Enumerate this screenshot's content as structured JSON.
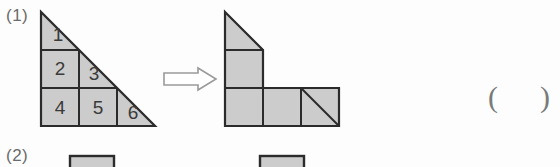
{
  "page": {
    "background_color": "#fdfdfd",
    "width": 560,
    "height": 167
  },
  "style": {
    "shape_fill": "#cccccc",
    "shape_stroke": "#2b2b2b",
    "digit_color": "#3a3a3a",
    "label_color": "#6b6b6b",
    "arrow_stroke": "#9a9a9a"
  },
  "problems": [
    {
      "label": "(1)",
      "answer_blank": {
        "open": "(",
        "close": ")"
      }
    },
    {
      "label": "(2)"
    }
  ],
  "arrow": {
    "glyph": "⟹",
    "direction": "right",
    "name": "transforms-into"
  },
  "left_figure": {
    "name": "right-triangle-grid",
    "description": "Right triangle subdivided into 6 numbered pieces",
    "grid": {
      "columns": 3,
      "rows": 3,
      "cell_px": 38
    },
    "cells": [
      {
        "id": 1,
        "label": "1",
        "col": 0,
        "row": 0,
        "shape": "triangle"
      },
      {
        "id": 2,
        "label": "2",
        "col": 0,
        "row": 1,
        "shape": "square"
      },
      {
        "id": 3,
        "label": "3",
        "col": 1,
        "row": 1,
        "shape": "triangle"
      },
      {
        "id": 4,
        "label": "4",
        "col": 0,
        "row": 2,
        "shape": "square"
      },
      {
        "id": 5,
        "label": "5",
        "col": 1,
        "row": 2,
        "shape": "square"
      },
      {
        "id": 6,
        "label": "6",
        "col": 2,
        "row": 2,
        "shape": "triangle"
      }
    ],
    "piece_labels": [
      "1",
      "2",
      "3",
      "4",
      "5",
      "6"
    ]
  },
  "right_figure": {
    "name": "l-shaped-rearrangement",
    "description": "L shaped figure assembled from the same six pieces",
    "grid": {
      "columns": 3,
      "rows": 3,
      "cell_px": 38
    },
    "cells": [
      {
        "col": 0,
        "row": 0,
        "shape": "triangle"
      },
      {
        "col": 0,
        "row": 1,
        "shape": "square"
      },
      {
        "col": 0,
        "row": 2,
        "shape": "square"
      },
      {
        "col": 1,
        "row": 2,
        "shape": "square"
      },
      {
        "col": 2,
        "row": 2,
        "shape": "triangle-diagonal"
      }
    ]
  },
  "bottom_row": {
    "name": "problem-2-partial",
    "cut_off": true,
    "shapes": 2
  }
}
